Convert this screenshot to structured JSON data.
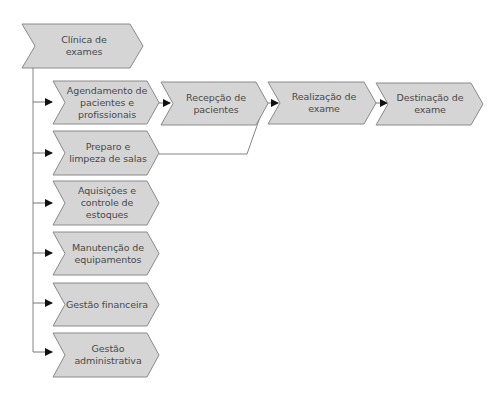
{
  "diagram": {
    "colors": {
      "fill": "#d5d5d5",
      "stroke": "#8a8a8a",
      "line": "#555555",
      "arrow": "#111111",
      "text": "#4a4a4a"
    },
    "root": {
      "label": "Clínica de exames"
    },
    "branches": [
      {
        "label": "Agendamento de pacientes e profissionais"
      },
      {
        "label": "Preparo e limpeza de salas"
      },
      {
        "label": "Aquisições e controle de estoques"
      },
      {
        "label": "Manutenção de equipamentos"
      },
      {
        "label": "Gestão financeira"
      },
      {
        "label": "Gestão administrativa"
      }
    ],
    "flow": [
      {
        "label": "Recepção de pacientes"
      },
      {
        "label": "Realização de exame"
      },
      {
        "label": "Destinação de exame"
      }
    ]
  }
}
